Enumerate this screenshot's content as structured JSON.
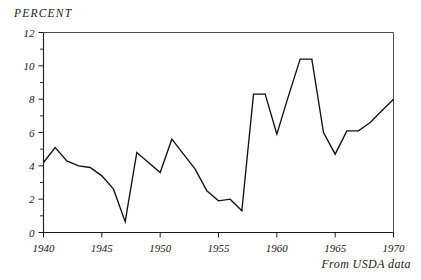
{
  "chart_data": {
    "type": "line",
    "title": "",
    "subtitle": "",
    "ylabel": "PERCENT",
    "xlabel": "",
    "annotation": "From USDA data",
    "grid": false,
    "legend": null,
    "xlim": [
      1940,
      1970
    ],
    "ylim": [
      0,
      12
    ],
    "xticks": [
      1940,
      1945,
      1950,
      1955,
      1960,
      1965,
      1970
    ],
    "xtick_labels": [
      "1940",
      "1945",
      "1950",
      "1955",
      "1960",
      "1965",
      "1970"
    ],
    "xminor_step": 1,
    "yticks": [
      0,
      2,
      4,
      6,
      8,
      10,
      12
    ],
    "ytick_labels": [
      "0",
      "2",
      "4",
      "6",
      "8",
      "10",
      "12"
    ],
    "yminor_step": 1,
    "x": [
      1940,
      1941,
      1942,
      1943,
      1944,
      1945,
      1946,
      1947,
      1948,
      1949,
      1950,
      1951,
      1952,
      1953,
      1954,
      1955,
      1956,
      1957,
      1958,
      1959,
      1960,
      1961,
      1962,
      1963,
      1964,
      1965,
      1966,
      1967,
      1968,
      1969,
      1970
    ],
    "values": [
      4.2,
      5.1,
      4.3,
      4.0,
      3.9,
      3.4,
      2.6,
      0.65,
      4.8,
      4.2,
      3.6,
      5.6,
      4.7,
      3.8,
      2.5,
      1.9,
      2.0,
      1.3,
      8.3,
      8.3,
      5.9,
      8.2,
      10.4,
      10.4,
      6.0,
      4.7,
      6.1,
      6.1,
      6.6,
      7.3,
      8.0
    ]
  },
  "axis": {
    "y_label": "PERCENT",
    "caption": "From USDA data"
  }
}
